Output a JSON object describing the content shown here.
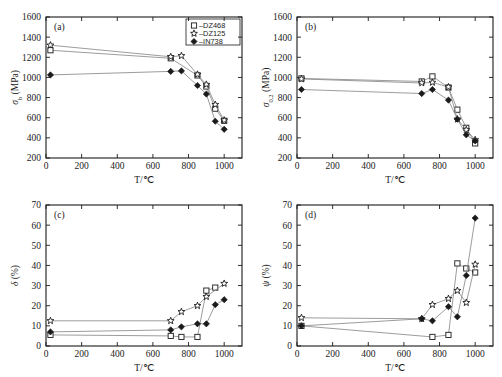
{
  "figure": {
    "title": "",
    "xlabel": "T/℃",
    "legend": {
      "entries": [
        {
          "label": "–DZ468",
          "marker": "square-open"
        },
        {
          "label": "–DZ125",
          "marker": "star-open"
        },
        {
          "label": "–IN738",
          "marker": "diamond-filled"
        }
      ]
    }
  },
  "chart_data": [
    {
      "type": "line",
      "panel": "(a)",
      "title": "",
      "xlabel": "T/℃",
      "ylabel": "σ b (MPa)",
      "ylabel_main": "σ",
      "ylabel_sub": "b",
      "ylabel_unit": "(MPa)",
      "xlim": [
        0,
        1100
      ],
      "ylim": [
        200,
        1600
      ],
      "xticks": [
        0,
        200,
        400,
        600,
        800,
        1000
      ],
      "yticks": [
        200,
        400,
        600,
        800,
        1000,
        1200,
        1400,
        1600
      ],
      "grid": false,
      "legend_position": "top-right",
      "series": [
        {
          "name": "DZ468",
          "marker": "square-open",
          "x": [
            25,
            700,
            850,
            900,
            950,
            1000
          ],
          "y": [
            1270,
            1190,
            1020,
            910,
            690,
            570
          ]
        },
        {
          "name": "DZ125",
          "marker": "star-open",
          "x": [
            25,
            700,
            760,
            850,
            900,
            950,
            1000
          ],
          "y": [
            1320,
            1205,
            1215,
            1030,
            930,
            730,
            575
          ]
        },
        {
          "name": "IN738",
          "marker": "diamond-filled",
          "x": [
            25,
            700,
            760,
            850,
            900,
            950,
            1000
          ],
          "y": [
            1025,
            1060,
            1065,
            920,
            835,
            565,
            485
          ]
        }
      ]
    },
    {
      "type": "line",
      "panel": "(b)",
      "title": "",
      "xlabel": "T/℃",
      "ylabel": "σ 0.2 (MPa)",
      "ylabel_main": "σ",
      "ylabel_sub": "0.2",
      "ylabel_unit": "(MPa)",
      "xlim": [
        0,
        1100
      ],
      "ylim": [
        200,
        1600
      ],
      "xticks": [
        0,
        200,
        400,
        600,
        800,
        1000
      ],
      "yticks": [
        200,
        400,
        600,
        800,
        1000,
        1200,
        1400,
        1600
      ],
      "grid": false,
      "legend_position": "none",
      "series": [
        {
          "name": "DZ468",
          "marker": "square-open",
          "x": [
            25,
            700,
            760,
            850,
            900,
            950,
            1000
          ],
          "y": [
            990,
            960,
            1010,
            900,
            680,
            500,
            345
          ]
        },
        {
          "name": "DZ125",
          "marker": "star-open",
          "x": [
            25,
            700,
            760,
            850,
            900,
            950,
            1000
          ],
          "y": [
            985,
            945,
            950,
            905,
            585,
            480,
            380
          ]
        },
        {
          "name": "IN738",
          "marker": "diamond-filled",
          "x": [
            25,
            700,
            760,
            850,
            900,
            950,
            1000
          ],
          "y": [
            880,
            840,
            880,
            775,
            585,
            430,
            370
          ]
        }
      ]
    },
    {
      "type": "line",
      "panel": "(c)",
      "title": "",
      "xlabel": "T/℃",
      "ylabel": "δ (%)",
      "ylabel_main": "δ",
      "ylabel_sub": "",
      "ylabel_unit": "(%)",
      "xlim": [
        0,
        1100
      ],
      "ylim": [
        0,
        70
      ],
      "xticks": [
        0,
        200,
        400,
        600,
        800,
        1000
      ],
      "yticks": [
        0,
        10,
        20,
        30,
        40,
        50,
        60,
        70
      ],
      "grid": false,
      "legend_position": "none",
      "series": [
        {
          "name": "DZ468",
          "marker": "square-open",
          "x": [
            25,
            700,
            760,
            850,
            900,
            950
          ],
          "y": [
            5.5,
            5.0,
            4.5,
            4.5,
            27.5,
            29.0
          ]
        },
        {
          "name": "DZ125",
          "marker": "star-open",
          "x": [
            25,
            700,
            760,
            850,
            900,
            1000
          ],
          "y": [
            12.5,
            12.5,
            17.0,
            20.0,
            24.5,
            31.0
          ]
        },
        {
          "name": "IN738",
          "marker": "diamond-filled",
          "x": [
            25,
            700,
            760,
            850,
            900,
            950,
            1000
          ],
          "y": [
            7.0,
            8.0,
            9.5,
            11.0,
            11.0,
            20.5,
            23.0
          ]
        }
      ]
    },
    {
      "type": "line",
      "panel": "(d)",
      "title": "",
      "xlabel": "T/℃",
      "ylabel": "ψ (%)",
      "ylabel_main": "ψ",
      "ylabel_sub": "",
      "ylabel_unit": "(%)",
      "xlim": [
        0,
        1100
      ],
      "ylim": [
        0,
        70
      ],
      "xticks": [
        0,
        200,
        400,
        600,
        800,
        1000
      ],
      "yticks": [
        0,
        10,
        20,
        30,
        40,
        50,
        60,
        70
      ],
      "grid": false,
      "legend_position": "none",
      "series": [
        {
          "name": "DZ468",
          "marker": "square-open",
          "x": [
            25,
            760,
            850,
            900,
            950,
            1000
          ],
          "y": [
            10.0,
            4.5,
            5.5,
            41.0,
            38.5,
            36.5
          ]
        },
        {
          "name": "DZ125",
          "marker": "star-open",
          "x": [
            25,
            700,
            760,
            850,
            900,
            950,
            1000
          ],
          "y": [
            14.0,
            13.5,
            20.5,
            23.5,
            27.5,
            21.5,
            40.5
          ]
        },
        {
          "name": "IN738",
          "marker": "diamond-filled",
          "x": [
            25,
            700,
            760,
            850,
            900,
            950,
            1000
          ],
          "y": [
            10.0,
            13.5,
            12.5,
            19.5,
            14.5,
            35.0,
            63.5
          ]
        }
      ]
    }
  ],
  "colors": {
    "axis": "#1a1a1a",
    "line": "#8a8a8a",
    "marker_fill": "#ffffff",
    "marker_stroke": "#1a1a1a",
    "background": "#ffffff"
  }
}
